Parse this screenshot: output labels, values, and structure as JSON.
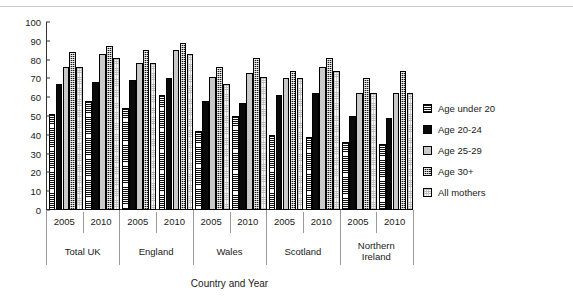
{
  "chart_data": {
    "type": "bar",
    "title": "",
    "xlabel": "Country and Year",
    "ylabel": "% who breastfed initially",
    "ylim": [
      0,
      100
    ],
    "ytick_step": 10,
    "yticks": [
      "100",
      "90",
      "80",
      "70",
      "60",
      "50",
      "40",
      "30",
      "20",
      "10",
      "0"
    ],
    "grid": false,
    "legend_position": "right",
    "series": [
      {
        "name": "Age under 20",
        "pattern": "horizontal-stripes",
        "values": [
          51,
          58,
          54,
          61,
          42,
          50,
          40,
          39,
          36,
          35
        ]
      },
      {
        "name": "Age 20-24",
        "pattern": "solid-black",
        "values": [
          67,
          68,
          69,
          70,
          58,
          57,
          61,
          62,
          50,
          49
        ]
      },
      {
        "name": "Age 25-29",
        "pattern": "solid-light-grey",
        "values": [
          76,
          83,
          78,
          85,
          71,
          73,
          70,
          76,
          62,
          62
        ]
      },
      {
        "name": "Age 30+",
        "pattern": "dark-dotted",
        "values": [
          84,
          87,
          85,
          89,
          76,
          81,
          74,
          81,
          70,
          74
        ]
      },
      {
        "name": "All mothers",
        "pattern": "white-dotted",
        "values": [
          76,
          81,
          78,
          83,
          67,
          71,
          70,
          74,
          62,
          62
        ]
      }
    ],
    "categories": [
      {
        "country": "Total  UK",
        "year": "2005"
      },
      {
        "country": "Total  UK",
        "year": "2010"
      },
      {
        "country": "England",
        "year": "2005"
      },
      {
        "country": "England",
        "year": "2010"
      },
      {
        "country": "Wales",
        "year": "2005"
      },
      {
        "country": "Wales",
        "year": "2010"
      },
      {
        "country": "Scotland",
        "year": "2005"
      },
      {
        "country": "Scotland",
        "year": "2010"
      },
      {
        "country": "Northern\nIreland",
        "year": "2005"
      },
      {
        "country": "Northern\nIreland",
        "year": "2010"
      }
    ],
    "country_groups": [
      {
        "label": "Total  UK",
        "years": [
          "2005",
          "2010"
        ]
      },
      {
        "label": "England",
        "years": [
          "2005",
          "2010"
        ]
      },
      {
        "label": "Wales",
        "years": [
          "2005",
          "2010"
        ]
      },
      {
        "label": "Scotland",
        "years": [
          "2005",
          "2010"
        ]
      },
      {
        "label": "Northern Ireland",
        "years": [
          "2005",
          "2010"
        ]
      }
    ]
  },
  "legend": {
    "items": [
      {
        "label": "Age under 20"
      },
      {
        "label": "Age 20-24"
      },
      {
        "label": "Age 25-29"
      },
      {
        "label": "Age 30+"
      },
      {
        "label": "All mothers"
      }
    ]
  },
  "colors": {
    "axis": "#333333",
    "series_black": "#0a0a0a",
    "series_grey": "#c9c9c9",
    "separator": "#9a9a9a",
    "background": "#ffffff"
  }
}
